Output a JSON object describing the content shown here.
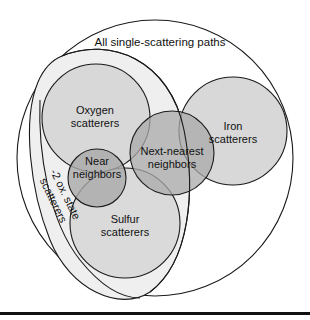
{
  "diagram": {
    "title": "All single-scattering paths",
    "sets": [
      {
        "id": "oxygen",
        "line1": "Oxygen",
        "line2": "scatterers"
      },
      {
        "id": "iron",
        "line1": "Iron",
        "line2": "scatterers"
      },
      {
        "id": "near",
        "line1": "Near",
        "line2": "neighbors"
      },
      {
        "id": "next-nearest",
        "line1": "Next-nearest",
        "line2": "neighbors"
      },
      {
        "id": "sulfur",
        "line1": "Sulfur",
        "line2": "scatterers"
      },
      {
        "id": "ox-state",
        "line1": "-2 ox. state",
        "line2": "scatterers"
      }
    ],
    "colors": {
      "outer_fill": "#ffffff",
      "ox_state_fill": "#efefef",
      "light_fill": "#d6d6d6",
      "dark_fill": "#a9a9a9",
      "stroke": "#1a1a1a",
      "baseline": "#111111"
    }
  }
}
